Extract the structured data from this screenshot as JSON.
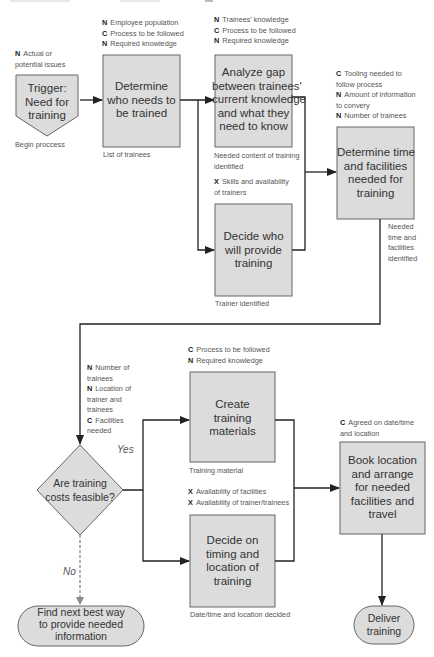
{
  "diagram": {
    "type": "flowchart",
    "title_partial": "Figure: training needs flowchart (title cut off at top)",
    "colors": {
      "box_fill": "#dcdcdc",
      "box_stroke": "#666666",
      "line": "#222222",
      "text": "#333333",
      "annotation_text": "#555555"
    },
    "legend_codes": {
      "N": "N",
      "C": "C",
      "X": "X"
    },
    "nodes": {
      "trigger": {
        "lines": [
          "Trigger:",
          "Need for",
          "training"
        ],
        "shape": "pentagon-down"
      },
      "determine_who": {
        "lines": [
          "Determine",
          "who needs to",
          "be trained"
        ],
        "shape": "rect"
      },
      "analyze_gap": {
        "lines": [
          "Analyze gap",
          "between trainees'",
          "current knowledge",
          "and what they",
          "need to know"
        ],
        "shape": "rect"
      },
      "decide_who": {
        "lines": [
          "Decide who",
          "will provide",
          "training"
        ],
        "shape": "rect"
      },
      "determine_time": {
        "lines": [
          "Determine time",
          "and facilities",
          "needed for",
          "training"
        ],
        "shape": "rect"
      },
      "costs_feasible": {
        "lines": [
          "Are training",
          "costs feasible?"
        ],
        "shape": "diamond"
      },
      "create_materials": {
        "lines": [
          "Create",
          "training",
          "materials"
        ],
        "shape": "rect"
      },
      "decide_timing": {
        "lines": [
          "Decide on",
          "timing and",
          "location of",
          "training"
        ],
        "shape": "rect"
      },
      "book_location": {
        "lines": [
          "Book location",
          "and arrange",
          "for needed",
          "facilities and",
          "travel"
        ],
        "shape": "rect"
      },
      "find_next_best": {
        "lines": [
          "Find next best way",
          "to provide needed",
          "information"
        ],
        "shape": "terminator"
      },
      "deliver": {
        "lines": [
          "Deliver",
          "training"
        ],
        "shape": "terminator"
      }
    },
    "annotations": {
      "trigger_inputs": [
        {
          "code": "N",
          "text": "Actual or"
        },
        {
          "code": "",
          "text": "potential issues"
        }
      ],
      "trigger_output": "Begin proccess",
      "determine_who_inputs": [
        {
          "code": "N",
          "text": "Employee population"
        },
        {
          "code": "C",
          "text": "Process to be followed"
        },
        {
          "code": "N",
          "text": "Required knowledge"
        }
      ],
      "determine_who_output": "List of trainees",
      "analyze_gap_inputs": [
        {
          "code": "N",
          "text": "Trainees' knowledge"
        },
        {
          "code": "C",
          "text": "Process to be followed"
        },
        {
          "code": "N",
          "text": "Required knowledge"
        }
      ],
      "analyze_gap_output": [
        "Needed content of training",
        "identified"
      ],
      "decide_who_inputs": [
        {
          "code": "X",
          "text": "Skills and availability"
        },
        {
          "code": "",
          "text": "of trainers"
        }
      ],
      "decide_who_output": "Trainer identified",
      "determine_time_inputs": [
        {
          "code": "C",
          "text": "Tooling needed to"
        },
        {
          "code": "",
          "text": "follow process"
        },
        {
          "code": "N",
          "text": "Amount of information"
        },
        {
          "code": "",
          "text": "to convery"
        },
        {
          "code": "N",
          "text": "Number of trainees"
        }
      ],
      "determine_time_output": [
        "Needed",
        "time and",
        "facilities",
        "identified"
      ],
      "costs_inputs": [
        {
          "code": "N",
          "text": "Number of"
        },
        {
          "code": "",
          "text": "trainees"
        },
        {
          "code": "N",
          "text": "Location of"
        },
        {
          "code": "",
          "text": "trainer and"
        },
        {
          "code": "",
          "text": "trainees"
        },
        {
          "code": "C",
          "text": "Facilities"
        },
        {
          "code": "",
          "text": "needed"
        }
      ],
      "create_materials_inputs": [
        {
          "code": "C",
          "text": "Process to be followed"
        },
        {
          "code": "N",
          "text": "Required knowledge"
        }
      ],
      "create_materials_output": "Training material",
      "decide_timing_inputs": [
        {
          "code": "X",
          "text": "Availability of facilities"
        },
        {
          "code": "X",
          "text": "Availability of trainer/trainees"
        }
      ],
      "decide_timing_output": "Date/time and location decided",
      "book_location_inputs": [
        {
          "code": "C",
          "text": "Agreed on date/time"
        },
        {
          "code": "",
          "text": "and location"
        }
      ],
      "yes_label": "Yes",
      "no_label": "No"
    }
  }
}
